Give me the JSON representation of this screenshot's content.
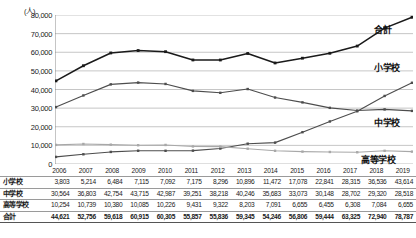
{
  "chart_data": {
    "type": "line",
    "title": "",
    "xlabel": "",
    "ylabel": "(人)",
    "unit_label": "(人)",
    "ylim": [
      0,
      80000
    ],
    "ytick_step": 10000,
    "grid": true,
    "legend_position": "right-inline",
    "categories": [
      "2006",
      "2007",
      "2008",
      "2009",
      "2010",
      "2011",
      "2012",
      "2013",
      "2014",
      "2015",
      "2016",
      "2017",
      "2018",
      "2019"
    ],
    "ytick_labels": [
      "0",
      "10,000",
      "20,000",
      "30,000",
      "40,000",
      "50,000",
      "60,000",
      "70,000",
      "80,000"
    ],
    "series": [
      {
        "name": "小学校",
        "color": "#4d4d4d",
        "values": [
          3803,
          5214,
          6484,
          7115,
          7092,
          7175,
          8296,
          10896,
          11472,
          17078,
          22841,
          28315,
          36536,
          43614
        ]
      },
      {
        "name": "中学校",
        "color": "#4d4d4d",
        "values": [
          30564,
          36803,
          42754,
          43715,
          42987,
          39251,
          38218,
          40246,
          35683,
          33073,
          30148,
          28702,
          29320,
          28518
        ]
      },
      {
        "name": "高等学校",
        "color": "#a8a8a8",
        "values": [
          10254,
          10739,
          10380,
          10085,
          10226,
          9431,
          9322,
          8203,
          7091,
          6655,
          6455,
          6308,
          7084,
          6655
        ]
      },
      {
        "name": "合計",
        "color": "#1a1a1a",
        "values": [
          44621,
          52756,
          59618,
          60915,
          60305,
          55857,
          55836,
          59345,
          54246,
          56806,
          59444,
          63325,
          72940,
          78787
        ]
      }
    ]
  },
  "table": {
    "header": [
      "",
      "2006",
      "2007",
      "2008",
      "2009",
      "2010",
      "2011",
      "2012",
      "2013",
      "2014",
      "2015",
      "2016",
      "2017",
      "2018",
      "2019"
    ],
    "rows": [
      {
        "label": "小学校",
        "cells": [
          "3,803",
          "5,214",
          "6,484",
          "7,115",
          "7,092",
          "7,175",
          "8,296",
          "10,896",
          "11,472",
          "17,078",
          "22,841",
          "28,315",
          "36,536",
          "43,614"
        ]
      },
      {
        "label": "中学校",
        "cells": [
          "30,564",
          "36,803",
          "42,754",
          "43,715",
          "42,987",
          "39,251",
          "38,218",
          "40,246",
          "35,683",
          "33,073",
          "30,148",
          "28,702",
          "29,320",
          "28,518"
        ]
      },
      {
        "label": "高等学校",
        "cells": [
          "10,254",
          "10,739",
          "10,380",
          "10,085",
          "10,226",
          "9,431",
          "9,322",
          "8,203",
          "7,091",
          "6,655",
          "6,455",
          "6,308",
          "7,084",
          "6,655"
        ]
      },
      {
        "label": "合計",
        "cells": [
          "44,621",
          "52,756",
          "59,618",
          "60,915",
          "60,305",
          "55,857",
          "55,836",
          "59,345",
          "54,246",
          "56,806",
          "59,444",
          "63,325",
          "72,940",
          "78,787"
        ]
      }
    ]
  },
  "series_labels": {
    "total": "合計",
    "elementary": "小学校",
    "junior_high": "中学校",
    "high_school": "高等学校"
  },
  "colors": {
    "grid": "#b8b8b8",
    "axis": "#808080",
    "total_line": "#1a1a1a",
    "elementary_line": "#4d4d4d",
    "junior_high_line": "#4d4d4d",
    "high_school_line": "#a8a8a8"
  }
}
